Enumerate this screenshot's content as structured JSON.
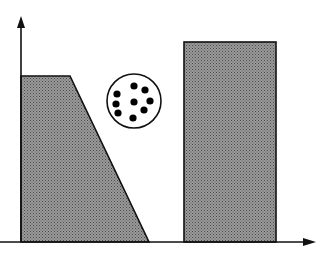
{
  "diagram": {
    "type": "schematic-axes-with-shapes",
    "colors": {
      "background": "#ffffff",
      "stroke": "#111111",
      "fill": "#8a8a8a",
      "fill_dots": "#6a6a6a",
      "particle": "#000000"
    },
    "axes": {
      "origin": [
        21,
        242
      ],
      "y_arrow_tip": [
        21,
        16
      ],
      "x_arrow_tip": [
        316,
        242
      ]
    },
    "shapes": [
      {
        "name": "trapezoid-region",
        "points": [
          [
            21,
            242
          ],
          [
            21,
            76
          ],
          [
            70,
            76
          ],
          [
            149,
            242
          ]
        ]
      },
      {
        "name": "rectangle-region",
        "x": 184,
        "y": 42,
        "width": 92,
        "height": 200
      }
    ],
    "circle": {
      "name": "particle-circle",
      "cx": 134,
      "cy": 101,
      "r": 27,
      "particles": [
        [
          134,
          86
        ],
        [
          145,
          90
        ],
        [
          117,
          94
        ],
        [
          150,
          101
        ],
        [
          116,
          104
        ],
        [
          134,
          102
        ],
        [
          118,
          113
        ],
        [
          144,
          110
        ],
        [
          133,
          118
        ]
      ],
      "particle_r": 3.6
    }
  }
}
